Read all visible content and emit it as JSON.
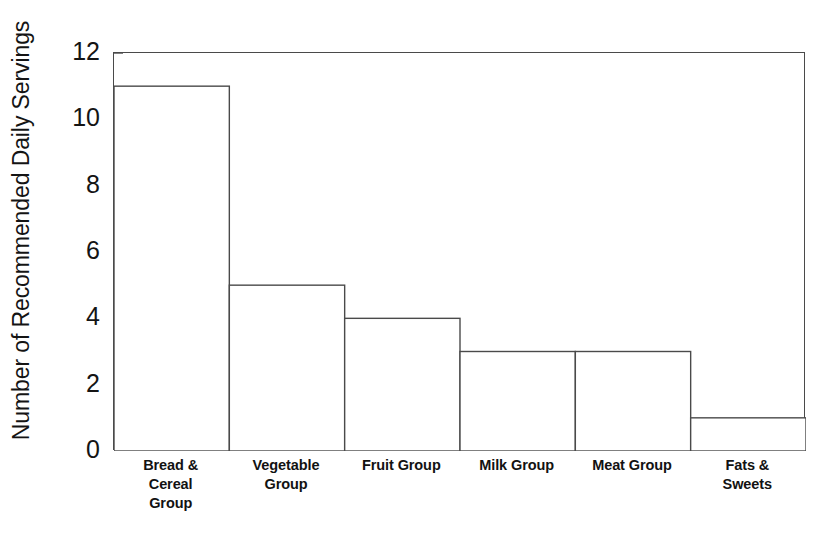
{
  "chart_data": {
    "type": "bar",
    "title": "",
    "xlabel": "",
    "ylabel": "Number of Recommended Daily Servings",
    "categories": [
      "Bread & Cereal Group",
      "Vegetable Group",
      "Fruit Group",
      "Milk Group",
      "Meat Group",
      "Fats & Sweets"
    ],
    "values": [
      11,
      5,
      4,
      3,
      3,
      1
    ],
    "ylim": [
      0,
      12
    ],
    "yticks": [
      0,
      2,
      4,
      6,
      8,
      10,
      12
    ],
    "ytick_labels": [
      "0",
      "2",
      "4",
      "6",
      "8",
      "10",
      "12"
    ],
    "grid": false,
    "legend": false,
    "bar_style": {
      "fill": "#ffffff",
      "edge": "#4a4a4a",
      "gap": 0
    },
    "axis_color": "#4a4a4a"
  },
  "axes": {
    "y_title": "Number of Recommended Daily Servings"
  },
  "x_labels": [
    {
      "line1": "Bread &",
      "line2": "Cereal",
      "line3": "Group"
    },
    {
      "line1": "Vegetable",
      "line2": "Group",
      "line3": ""
    },
    {
      "line1": "Fruit Group",
      "line2": "",
      "line3": ""
    },
    {
      "line1": "Milk Group",
      "line2": "",
      "line3": ""
    },
    {
      "line1": "Meat Group",
      "line2": "",
      "line3": ""
    },
    {
      "line1": "Fats &",
      "line2": "Sweets",
      "line3": ""
    }
  ]
}
